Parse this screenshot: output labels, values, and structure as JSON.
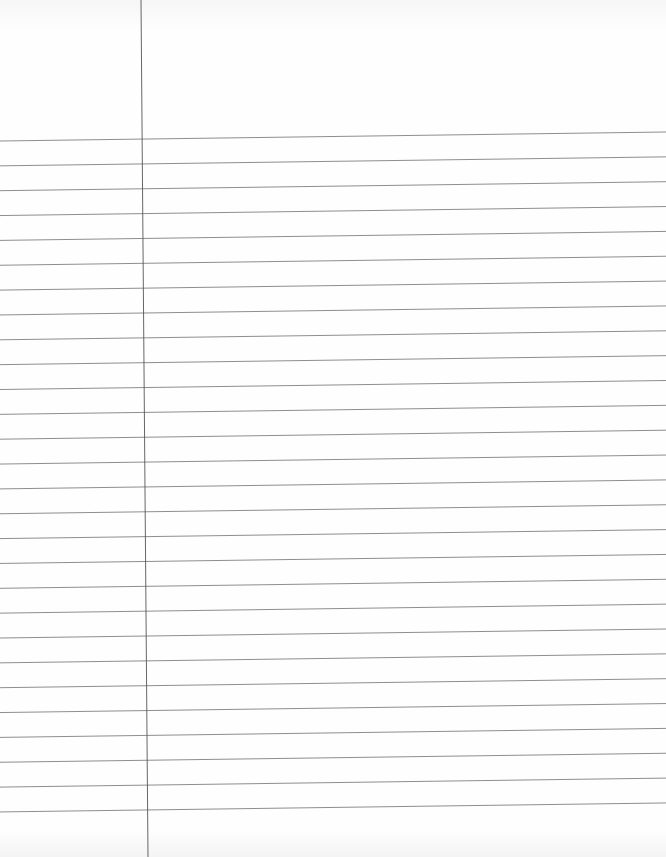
{
  "page": {
    "type": "lined-paper",
    "background_color": "#fdfdfd",
    "rule_color": "#7a7a7a",
    "margin_color": "#555555"
  },
  "margin_line": {
    "x_top": 141,
    "x_bottom": 148,
    "y_top": 0,
    "y_bottom": 857
  },
  "ruled_lines": {
    "count": 28,
    "first_y_left": 141,
    "first_y_right": 132,
    "spacing": 24.85,
    "x_start": 0,
    "x_end": 666
  }
}
